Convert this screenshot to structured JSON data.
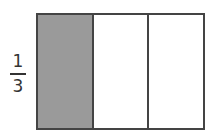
{
  "fraction": {
    "numerator": "1",
    "denominator": "3"
  },
  "diagram": {
    "parts": [
      {
        "shaded": true
      },
      {
        "shaded": false
      },
      {
        "shaded": false
      }
    ],
    "shade_color": "#9a9a9a"
  }
}
